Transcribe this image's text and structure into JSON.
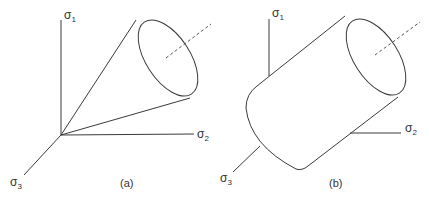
{
  "figure": {
    "panels": [
      {
        "id": "a",
        "caption": "(a)",
        "shape": "cone",
        "axes": {
          "sigma1": {
            "symbol": "σ",
            "subscript": "1"
          },
          "sigma2": {
            "symbol": "σ",
            "subscript": "2"
          },
          "sigma3": {
            "symbol": "σ",
            "subscript": "3"
          }
        }
      },
      {
        "id": "b",
        "caption": "(b)",
        "shape": "cylinder",
        "axes": {
          "sigma1": {
            "symbol": "σ",
            "subscript": "1"
          },
          "sigma2": {
            "symbol": "σ",
            "subscript": "2"
          },
          "sigma3": {
            "symbol": "σ",
            "subscript": "3"
          }
        }
      }
    ],
    "colors": {
      "line": "#3a3a3a",
      "background": "#ffffff"
    }
  }
}
